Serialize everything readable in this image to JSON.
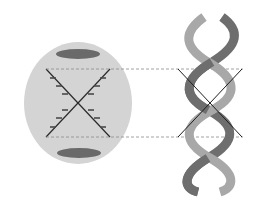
{
  "diagram": {
    "colors": {
      "background": "#ffffff",
      "pattern_disc": "#d4d4d4",
      "meridional_spots": "#6a6a6a",
      "x_lines": "#2a2a2a",
      "guide_lines": "#8a8a8a",
      "strand_light": "#a8a8a8",
      "strand_dark": "#6e6e6e"
    },
    "elements": [
      {
        "id": "diffraction-pattern",
        "type": "ellipse-with-X"
      },
      {
        "id": "double-helix",
        "type": "ribbon-helix"
      },
      {
        "id": "guide-lines",
        "type": "dashed-horizontal",
        "count": 2
      }
    ]
  }
}
